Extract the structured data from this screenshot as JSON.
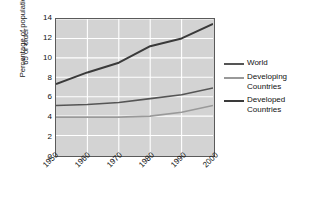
{
  "chart_data": {
    "type": "line",
    "title": "",
    "xlabel": "",
    "ylabel": "Percentage of population 65 or older",
    "x": [
      1950,
      1960,
      1970,
      1980,
      1990,
      2000
    ],
    "xtick_labels": [
      "1950",
      "1960",
      "1970",
      "1980",
      "1990",
      "2000"
    ],
    "ytick_labels": [
      "0",
      "2",
      "4",
      "6",
      "8",
      "10",
      "12",
      "14"
    ],
    "yticks": [
      0,
      2,
      4,
      6,
      8,
      10,
      12,
      14
    ],
    "ylim": [
      0,
      14
    ],
    "xlim": [
      1950,
      2000
    ],
    "grid": true,
    "legend_position": "right",
    "plot_background": "#d3d3d3",
    "gridline_color": "#ffffff",
    "series": [
      {
        "name": "World",
        "color": "#555555",
        "width": 1.6,
        "values": [
          5.1,
          5.2,
          5.4,
          5.8,
          6.2,
          6.9
        ]
      },
      {
        "name": "Developing\nCountries",
        "color": "#999999",
        "width": 1.6,
        "values": [
          3.9,
          3.9,
          3.9,
          4.0,
          4.4,
          5.1
        ]
      },
      {
        "name": "Developed\nCountries",
        "color": "#3a3a3a",
        "width": 2.0,
        "values": [
          7.3,
          8.5,
          9.5,
          11.2,
          12.0,
          13.5
        ]
      }
    ]
  },
  "axis": {
    "y_title_line1": "Percentage of population",
    "y_title_line2": "65 or older"
  },
  "legend": {
    "entries": [
      {
        "label": "World",
        "color": "#555555"
      },
      {
        "label": "Developing\nCountries",
        "color": "#999999"
      },
      {
        "label": "Developed\nCountries",
        "color": "#3a3a3a"
      }
    ]
  }
}
